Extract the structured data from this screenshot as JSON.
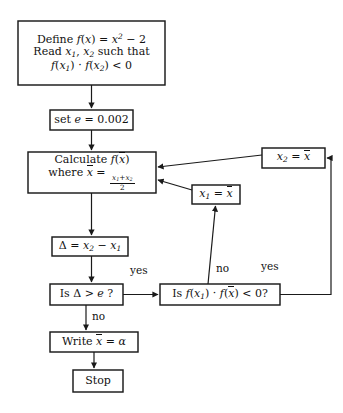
{
  "diagram": {
    "type": "flowchart",
    "canvas": {
      "width": 343,
      "height": 413
    },
    "colors": {
      "stroke": "#1a1a1a",
      "fill": "#ffffff",
      "text": "#111111"
    }
  },
  "nodes": [
    {
      "id": "define",
      "name": "define-box",
      "shape": "rect",
      "x": 18,
      "y": 21,
      "w": 147,
      "h": 64,
      "font_size": 11,
      "lines": [
        "Define f(x) = x² − 2",
        "Read x₁, x₂ such that",
        "f(x₁) · f(x₂) < 0"
      ]
    },
    {
      "id": "set_e",
      "name": "set-epsilon-box",
      "shape": "rect",
      "x": 50,
      "y": 110,
      "w": 83,
      "h": 20,
      "font_size": 11,
      "lines": [
        "set e = 0.002"
      ]
    },
    {
      "id": "calculate",
      "name": "calculate-box",
      "shape": "rect",
      "x": 28,
      "y": 152,
      "w": 128,
      "h": 41,
      "font_size": 11,
      "lines": [
        "Calculate f(x̄)",
        "where x̄ = (x₁+x₂)/2"
      ]
    },
    {
      "id": "x2_assign",
      "name": "x2-assign-box",
      "shape": "rect",
      "x": 262,
      "y": 148,
      "w": 63,
      "h": 20,
      "font_size": 11,
      "lines": [
        "x₂ = x̄"
      ]
    },
    {
      "id": "x1_assign",
      "name": "x1-assign-box",
      "shape": "rect",
      "x": 192,
      "y": 185,
      "w": 48,
      "h": 19,
      "font_size": 11,
      "lines": [
        "x₁ = x̄"
      ]
    },
    {
      "id": "delta",
      "name": "delta-box",
      "shape": "rect",
      "x": 52,
      "y": 237,
      "w": 76,
      "h": 19,
      "font_size": 11,
      "lines": [
        "Δ = x₂ − x₁"
      ]
    },
    {
      "id": "is_delta",
      "name": "is-delta-greater-decision",
      "shape": "rect",
      "x": 50,
      "y": 284,
      "w": 73,
      "h": 21,
      "font_size": 11,
      "lines": [
        "Is Δ > e ?"
      ]
    },
    {
      "id": "is_fx1",
      "name": "is-product-negative-decision",
      "shape": "rect",
      "x": 160,
      "y": 284,
      "w": 120,
      "h": 21,
      "font_size": 11,
      "lines": [
        "Is f(x₁) · f(x̄) < 0?"
      ]
    },
    {
      "id": "write",
      "name": "write-result-box",
      "shape": "rect",
      "x": 50,
      "y": 332,
      "w": 88,
      "h": 20,
      "font_size": 11,
      "lines": [
        "Write x̄ = α"
      ]
    },
    {
      "id": "stop",
      "name": "stop-box",
      "shape": "rect",
      "x": 73,
      "y": 370,
      "w": 50,
      "h": 22,
      "font_size": 11,
      "lines": [
        "Stop"
      ]
    }
  ],
  "edge_labels": [
    {
      "id": "yes_left",
      "name": "edge-label-yes-left",
      "text": "yes",
      "x": 130,
      "y": 264
    },
    {
      "id": "no_down",
      "name": "edge-label-no-down",
      "text": "no",
      "x": 92,
      "y": 310
    },
    {
      "id": "no_up",
      "name": "edge-label-no-up",
      "text": "no",
      "x": 216,
      "y": 262
    },
    {
      "id": "yes_right",
      "name": "edge-label-yes-right",
      "text": "yes",
      "x": 261,
      "y": 260
    }
  ],
  "edges": [
    {
      "id": "e1",
      "name": "edge-define-to-set-e",
      "from": "define",
      "to": "set_e"
    },
    {
      "id": "e2",
      "name": "edge-set-e-to-calculate",
      "from": "set_e",
      "to": "calculate"
    },
    {
      "id": "e3",
      "name": "edge-calculate-to-delta",
      "from": "calculate",
      "to": "delta"
    },
    {
      "id": "e4",
      "name": "edge-delta-to-is-delta",
      "from": "delta",
      "to": "is_delta"
    },
    {
      "id": "e5",
      "name": "edge-is-delta-yes-to-is-fx1",
      "from": "is_delta",
      "to": "is_fx1",
      "label": "yes"
    },
    {
      "id": "e6",
      "name": "edge-is-delta-no-to-write",
      "from": "is_delta",
      "to": "write",
      "label": "no"
    },
    {
      "id": "e7",
      "name": "edge-write-to-stop",
      "from": "write",
      "to": "stop"
    },
    {
      "id": "e8",
      "name": "edge-is-fx1-no-to-x1-assign",
      "from": "is_fx1",
      "to": "x1_assign",
      "label": "no"
    },
    {
      "id": "e9",
      "name": "edge-is-fx1-yes-to-x2-assign",
      "from": "is_fx1",
      "to": "x2_assign",
      "label": "yes"
    },
    {
      "id": "e10",
      "name": "edge-x1-assign-to-calculate",
      "from": "x1_assign",
      "to": "calculate"
    },
    {
      "id": "e11",
      "name": "edge-x2-assign-to-calculate",
      "from": "x2_assign",
      "to": "calculate"
    }
  ]
}
